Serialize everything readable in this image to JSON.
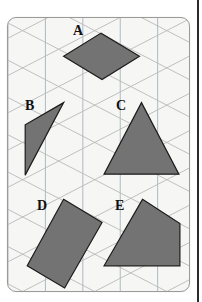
{
  "figure": {
    "panel": {
      "background_color": "#f6f6f4",
      "border_color": "#9a9a9a",
      "corner_radius": 9
    },
    "grid": {
      "type": "isometric-triangular",
      "line_color": "#b9b9b9",
      "vertical_line_color": "#a9b3bd",
      "spacing_px": 37,
      "angle_degrees": 30
    },
    "shape_style": {
      "fill_color": "#737373",
      "stroke_color": "#1c1c1c",
      "stroke_width": 1.2
    },
    "shapes": [
      {
        "label": "A",
        "name": "rhombus",
        "points": "55,38 92,15 130,38 93,61",
        "label_x": 65,
        "label_y": 6
      },
      {
        "label": "B",
        "name": "thin-triangle",
        "points": "55,84 17,106 17,156",
        "label_x": 17,
        "label_y": 81
      },
      {
        "label": "C",
        "name": "equilateral-triangle",
        "points": "132,84 169,155 95,155",
        "label_x": 108,
        "label_y": 81
      },
      {
        "label": "D",
        "name": "tilted-rectangle",
        "points": "55,180 93,203 56,268 19,246",
        "label_x": 29,
        "label_y": 181
      },
      {
        "label": "E",
        "name": "quadrilateral",
        "points": "133,180 170,204 170,246 95,246",
        "label_x": 107,
        "label_y": 181
      }
    ],
    "margin_glyph": "s"
  }
}
